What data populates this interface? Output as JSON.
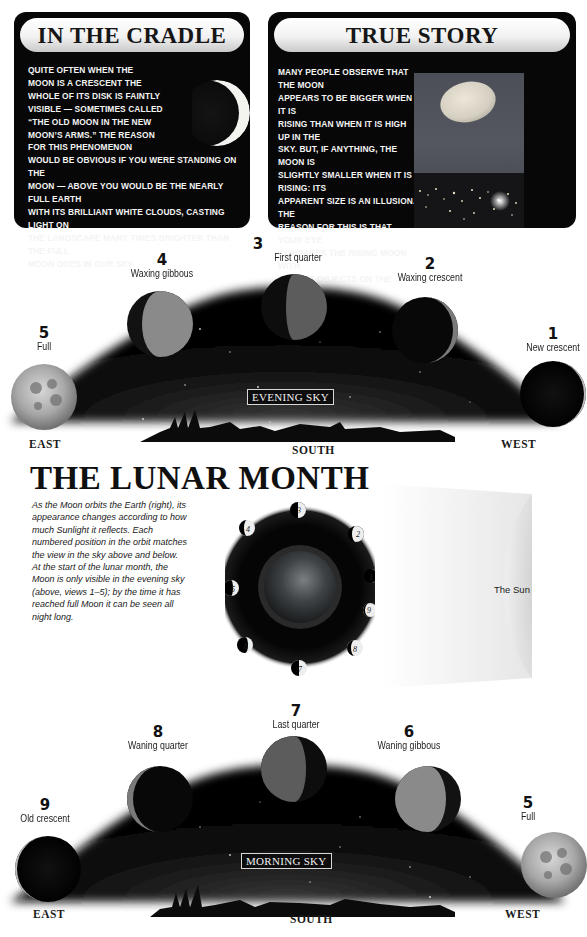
{
  "cards": {
    "cradle": {
      "title": "IN THE CRADLE",
      "text_lines": [
        "Quite often when the",
        "Moon is a crescent the",
        "whole of its disk is faintly",
        "visible — sometimes called",
        "“the old moon in the new",
        "moon’s arms.” The reason",
        "for this phenomenon",
        "would be obvious if you were standing on the",
        "Moon — above you would be the nearly full Earth",
        "with its brilliant white clouds, casting light on",
        "the landscape many times brighter than the full",
        "moon does in our sky."
      ],
      "figure": "crescent-moon-icon"
    },
    "true_story": {
      "title": "TRUE STORY",
      "text_lines": [
        "Many people observe that the Moon",
        "appears to be bigger when it is",
        "rising than when it is high up in the",
        "sky. But, if anything, the Moon is",
        "slightly smaller when it is rising: its",
        "apparent size is an illusion. The",
        "reason for this is that your eye",
        "compares the rising Moon with",
        "distant objects on the landscape —",
        "not, as some books suggest, the",
        "lensing effect of the air near the",
        "horizon “magnifying” the image."
      ],
      "figure": "moonrise-over-city-photo"
    }
  },
  "evening_sky": {
    "caption": "EVENING SKY",
    "directions": {
      "left": "EAST",
      "center": "SOUTH",
      "right": "WEST"
    },
    "phases": [
      {
        "num": "5",
        "name": "Full"
      },
      {
        "num": "4",
        "name": "Waxing gibbous"
      },
      {
        "num": "3",
        "name": "First quarter"
      },
      {
        "num": "2",
        "name": "Waxing crescent"
      },
      {
        "num": "1",
        "name": "New crescent"
      }
    ]
  },
  "lunar_month": {
    "title": "THE LUNAR MONTH",
    "intro_paragraphs": [
      "As the Moon orbits the Earth (right), its appearance changes according to how much Sunlight it reflects. Each numbered position in the orbit matches the view in the sky above and below.",
      "At the start of the lunar month, the Moon is only visible in the evening sky (above, views 1–5); by the time it has reached full Moon it can be seen all night long."
    ],
    "orbit_positions": [
      "1",
      "2",
      "3",
      "4",
      "5",
      "6",
      "7",
      "8",
      "9"
    ],
    "sun_label": "The Sun"
  },
  "morning_sky": {
    "caption": "MORNING SKY",
    "directions": {
      "left": "EAST",
      "center": "SOUTH",
      "right": "WEST"
    },
    "phases": [
      {
        "num": "9",
        "name": "Old crescent"
      },
      {
        "num": "8",
        "name": "Waning quarter"
      },
      {
        "num": "7",
        "name": "Last quarter"
      },
      {
        "num": "6",
        "name": "Waning gibbous"
      },
      {
        "num": "5",
        "name": "Full"
      }
    ]
  },
  "colors": {
    "card_bg": "#070707",
    "sky_dark": "#050505",
    "page_bg": "#ffffff"
  }
}
